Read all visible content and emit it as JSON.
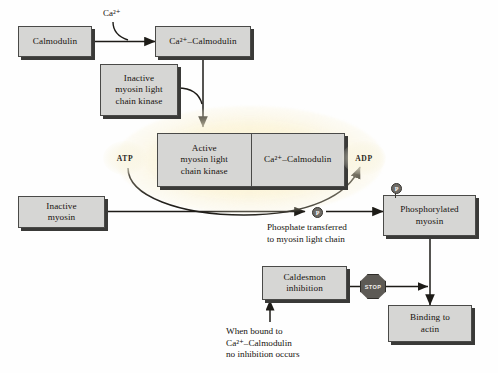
{
  "diagram": {
    "colors": {
      "box_fill": "#d6d6d4",
      "box_border": "#4a4a48",
      "box_shadow": "#3a3a38",
      "arrow": "#1d1b17",
      "glow": "#fff8dc",
      "stop_fill": "#5d5a55",
      "background": "#fefefe"
    },
    "nodes": {
      "calmodulin": "Calmodulin",
      "ca_calmodulin": "Ca²⁺–Calmodulin",
      "inactive_kinase_line1": "Inactive",
      "inactive_kinase_line2": "myosin light",
      "inactive_kinase_line3": "chain kinase",
      "active_kinase_line1": "Active",
      "active_kinase_line2": "myosin light",
      "active_kinase_line3": "chain kinase",
      "complex_calmodulin": "Ca²⁺–Calmodulin",
      "inactive_myosin_line1": "Inactive",
      "inactive_myosin_line2": "myosin",
      "phosphorylated_myosin_line1": "Phosphorylated",
      "phosphorylated_myosin_line2": "myosin",
      "caldesmon_line1": "Caldesmon",
      "caldesmon_line2": "inhibition",
      "binding_actin_line1": "Binding to",
      "binding_actin_line2": "actin"
    },
    "labels": {
      "calcium_ion": "Ca²⁺",
      "atp": "ATP",
      "adp": "ADP",
      "phosphate_symbol": "P",
      "stop": "STOP",
      "phosphate_caption_line1": "Phosphate transferred",
      "phosphate_caption_line2": "to myosin light chain",
      "caldesmon_caption_line1": "When bound to",
      "caldesmon_caption_line2": "Ca²⁺–Calmodulin",
      "caldesmon_caption_line3": "no inhibition occurs"
    }
  }
}
